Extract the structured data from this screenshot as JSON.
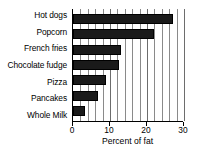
{
  "chart_data": {
    "type": "bar",
    "orientation": "horizontal",
    "title": "",
    "subtitle": "",
    "xlabel": "Percent of fat",
    "ylabel": "",
    "categories": [
      "Hot dogs",
      "Popcorn",
      "French fries",
      "Chocolate fudge",
      "Pizza",
      "Pancakes",
      "Whole Milk"
    ],
    "values": [
      27,
      22,
      13,
      12.5,
      9,
      6.8,
      3.3
    ],
    "xlim": [
      0,
      30
    ],
    "xticks": [
      0,
      10,
      20,
      30
    ],
    "xticklabels": [
      "0",
      "10",
      "20",
      "30"
    ],
    "minor_gridline_step": 2,
    "grid": true,
    "grid_axis": "x",
    "legend": null,
    "bar_color": "#1a1a1a",
    "axis_color": "#000000",
    "grid_color": "#8a8a8a",
    "background_color": "#ffffff"
  }
}
